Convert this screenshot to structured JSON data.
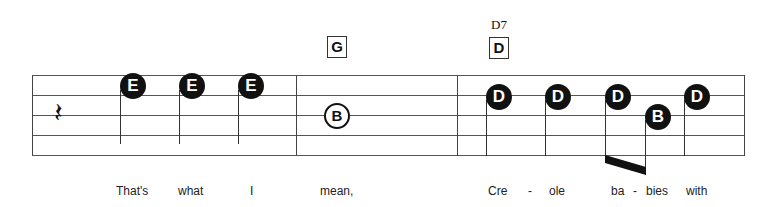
{
  "chords": [
    {
      "box": "G",
      "name": ""
    },
    {
      "box": "D",
      "name": "D7"
    }
  ],
  "measures": [
    {
      "notes": [
        "rest",
        "E",
        "E",
        "E"
      ]
    },
    {
      "notes": [
        "B"
      ]
    },
    {
      "notes": [
        "D",
        "D",
        "D",
        "B",
        "D"
      ]
    }
  ],
  "notes": {
    "n1": "E",
    "n2": "E",
    "n3": "E",
    "n4": "B",
    "n5": "D",
    "n6": "D",
    "n7": "D",
    "n8": "B",
    "n9": "D"
  },
  "rest_glyph": "𝄽",
  "lyrics": [
    "That's",
    "what",
    "I",
    "mean,",
    "Cre",
    "-",
    "ole",
    "ba",
    "-",
    "bies",
    "with"
  ]
}
